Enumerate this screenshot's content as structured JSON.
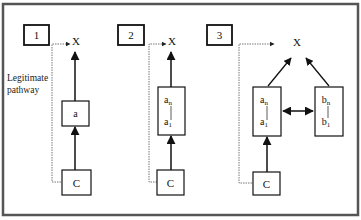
{
  "figure": {
    "side_label_line1": "Legitimate",
    "side_label_line2": "pathway",
    "panels": [
      {
        "number": "1",
        "target": "X",
        "chain": [
          {
            "label": "a"
          }
        ],
        "source": "C"
      },
      {
        "number": "2",
        "target": "X",
        "chain": [
          {
            "top": "a",
            "top_sub": "n",
            "bottom": "a",
            "bottom_sub": "1"
          }
        ],
        "source": "C"
      },
      {
        "number": "3",
        "target": "X",
        "chain": [
          {
            "top": "a",
            "top_sub": "n",
            "bottom": "a",
            "bottom_sub": "1"
          },
          {
            "top": "b",
            "top_sub": "n",
            "bottom": "b",
            "bottom_sub": "1"
          }
        ],
        "source": "C"
      }
    ]
  },
  "colors": {
    "line": "#111111",
    "dotted": "#777777",
    "frame": "#555555"
  }
}
